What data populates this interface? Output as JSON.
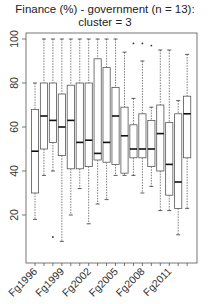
{
  "chart_data": {
    "type": "boxplot",
    "title": "Finance (%) - government (n = 13):",
    "subtitle": "cluster = 3",
    "xlabel": "",
    "ylabel": "",
    "ylim": [
      0,
      100
    ],
    "yticks": [
      20,
      40,
      60,
      80,
      100
    ],
    "grid": false,
    "legend": null,
    "categories": [
      "Fg1996",
      "Fg1997",
      "Fg1998",
      "Fg1999",
      "Fg2000",
      "Fg2001",
      "Fg2002",
      "Fg2003",
      "Fg2004",
      "Fg2005",
      "Fg2006",
      "Fg2007",
      "Fg2008",
      "Fg2009",
      "Fg2010",
      "Fg2011",
      "Fg2012",
      "Fg2013"
    ],
    "shown_tick_labels": [
      "Fg1996",
      "Fg1999",
      "Fg2002",
      "Fg2005",
      "Fg2008",
      "Fg2011"
    ],
    "boxes": [
      {
        "low": 18,
        "q1": 30,
        "median": 49,
        "q3": 68,
        "high": 80,
        "outliers": []
      },
      {
        "low": 38,
        "q1": 50,
        "median": 65,
        "q3": 80,
        "high": 100,
        "outliers": []
      },
      {
        "low": 40,
        "q1": 53,
        "median": 63,
        "q3": 80,
        "high": 100,
        "outliers": [
          10
        ]
      },
      {
        "low": 8,
        "q1": 47,
        "median": 60,
        "q3": 75,
        "high": 100,
        "outliers": []
      },
      {
        "low": 20,
        "q1": 41,
        "median": 63,
        "q3": 79,
        "high": 100,
        "outliers": []
      },
      {
        "low": 32,
        "q1": 41,
        "median": 53,
        "q3": 80,
        "high": 100,
        "outliers": []
      },
      {
        "low": 16,
        "q1": 42,
        "median": 54,
        "q3": 80,
        "high": 100,
        "outliers": []
      },
      {
        "low": 25,
        "q1": 45,
        "median": 48,
        "q3": 91,
        "high": 100,
        "outliers": []
      },
      {
        "low": 27,
        "q1": 44,
        "median": 53,
        "q3": 87,
        "high": 100,
        "outliers": []
      },
      {
        "low": 38,
        "q1": 43,
        "median": 65,
        "q3": 78,
        "high": 100,
        "outliers": []
      },
      {
        "low": 38,
        "q1": 39,
        "median": 56,
        "q3": 69,
        "high": 94,
        "outliers": []
      },
      {
        "low": 38,
        "q1": 46,
        "median": 50,
        "q3": 61,
        "high": 73,
        "outliers": [
          98
        ]
      },
      {
        "low": 30,
        "q1": 46,
        "median": 50,
        "q3": 66,
        "high": 90,
        "outliers": [
          98
        ]
      },
      {
        "low": 33,
        "q1": 42,
        "median": 50,
        "q3": 63,
        "high": 69,
        "outliers": [
          97
        ]
      },
      {
        "low": 22,
        "q1": 40,
        "median": 57,
        "q3": 70,
        "high": 95,
        "outliers": []
      },
      {
        "low": 22,
        "q1": 29,
        "median": 43,
        "q3": 62,
        "high": 95,
        "outliers": []
      },
      {
        "low": 11,
        "q1": 23,
        "median": 35,
        "q3": 66,
        "high": 72,
        "outliers": []
      },
      {
        "low": 23,
        "q1": 46,
        "median": 66,
        "q3": 74,
        "high": 93,
        "outliers": []
      }
    ]
  },
  "header": {
    "title": "Finance (%) - government (n = 13):",
    "subtitle": "cluster = 3"
  }
}
